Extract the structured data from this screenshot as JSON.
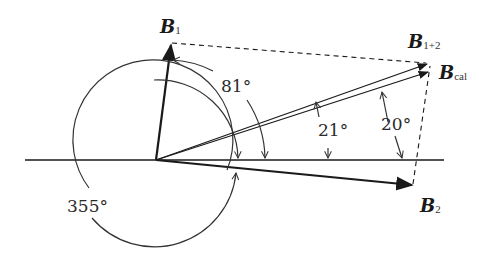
{
  "diagram": {
    "vectors": [
      {
        "id": "B1",
        "label": "B",
        "subscript": "1"
      },
      {
        "id": "B12",
        "label": "B",
        "subscript": "1+2"
      },
      {
        "id": "Bcal",
        "label": "B",
        "subscript": "cal"
      },
      {
        "id": "B2",
        "label": "B",
        "subscript": "2"
      }
    ],
    "angles": {
      "b1": "81°",
      "b12": "21°",
      "bcal": "20°",
      "b2": "355°"
    },
    "colors": {
      "stroke": "#1a1a1a",
      "text": "#2a2a2a"
    }
  }
}
